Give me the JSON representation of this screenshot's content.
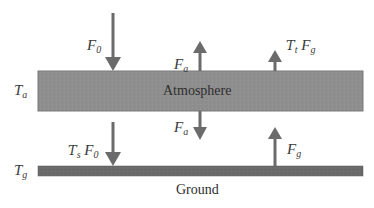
{
  "diagram": {
    "type": "energy-balance-schematic",
    "layers": {
      "atmosphere": {
        "label": "Atmosphere",
        "temperature_label": "T",
        "temperature_sub": "a",
        "color": "#8e8e8e"
      },
      "ground": {
        "label": "Ground",
        "temperature_label": "T",
        "temperature_sub": "g",
        "color": "#6a6a6a"
      }
    },
    "fluxes": {
      "incoming_solar": {
        "symbol": "F",
        "sub": "0",
        "direction": "down"
      },
      "atmosphere_up": {
        "symbol": "F",
        "sub": "a",
        "direction": "up"
      },
      "atmosphere_down": {
        "symbol": "F",
        "sub": "a",
        "direction": "down"
      },
      "transmitted_ground": {
        "tau": "T",
        "tau_sub": "t",
        "symbol": "F",
        "sub": "g",
        "direction": "up"
      },
      "transmitted_solar": {
        "tau": "T",
        "tau_sub": "s",
        "symbol": "F",
        "sub": "0",
        "direction": "down"
      },
      "ground_up": {
        "symbol": "F",
        "sub": "g",
        "direction": "up"
      }
    },
    "arrow_color": "#6b6b6b"
  }
}
